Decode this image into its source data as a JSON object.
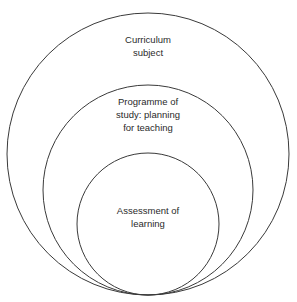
{
  "diagram": {
    "type": "nested-circles",
    "stroke_color": "#3a3a3a",
    "background": "#ffffff",
    "circles": [
      {
        "id": "outer",
        "label_lines": [
          "Curriculum",
          "subject"
        ],
        "cx": 148,
        "cy": 154,
        "r": 141
      },
      {
        "id": "middle",
        "label_lines": [
          "Programme of",
          "study: planning",
          "for teaching"
        ],
        "cx": 148,
        "cy": 190,
        "r": 105
      },
      {
        "id": "inner",
        "label_lines": [
          "Assessment of",
          "learning"
        ],
        "cx": 148,
        "cy": 224,
        "r": 71
      }
    ]
  }
}
